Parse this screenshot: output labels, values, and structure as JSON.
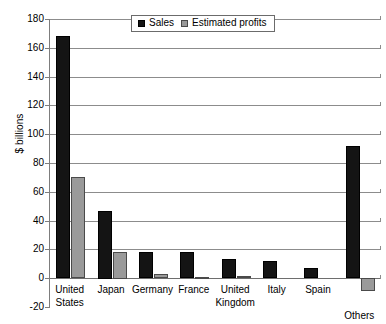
{
  "chart_data": {
    "type": "bar",
    "title": "",
    "subtitle": "",
    "xlabel": "",
    "ylabel": "$ billions",
    "ylim": [
      -20,
      180
    ],
    "ytick_step": 20,
    "yticks": [
      180,
      160,
      140,
      120,
      100,
      80,
      60,
      40,
      20,
      0,
      -20
    ],
    "ytick_labels": [
      "180",
      "160",
      "140",
      "120",
      "100",
      "80",
      "60",
      "40",
      "20",
      "0",
      "-20"
    ],
    "grid": "horizontal",
    "legend_position": "top-center",
    "categories": [
      "United\nStates",
      "Japan",
      "Germany",
      "France",
      "United\nKingdom",
      "Italy",
      "Spain",
      "Others"
    ],
    "series": [
      {
        "name": "Sales",
        "color": "#141414",
        "values": [
          168,
          47,
          18,
          18,
          13,
          12,
          7,
          92
        ]
      },
      {
        "name": "Estimated profits",
        "color": "#9a9a9a",
        "values": [
          70,
          18.5,
          3,
          1,
          1.5,
          0,
          0.5,
          -9
        ]
      }
    ],
    "annotations": []
  },
  "legend": {
    "entries": [
      {
        "label": "Sales",
        "swatch": "black-square-icon"
      },
      {
        "label": "Estimated profits",
        "swatch": "gray-square-icon"
      }
    ]
  }
}
